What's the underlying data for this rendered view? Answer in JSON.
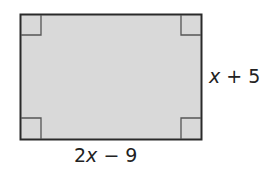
{
  "figure": {
    "shape": "rectangle",
    "fill_color": "#d9d9d9",
    "stroke_color": "#2a2a2a",
    "right_angle_marks": 4,
    "labels": {
      "right_side": {
        "var": "x",
        "rest": " + 5"
      },
      "bottom_side": {
        "coef": "2",
        "var": "x",
        "rest": " − 9"
      }
    }
  }
}
